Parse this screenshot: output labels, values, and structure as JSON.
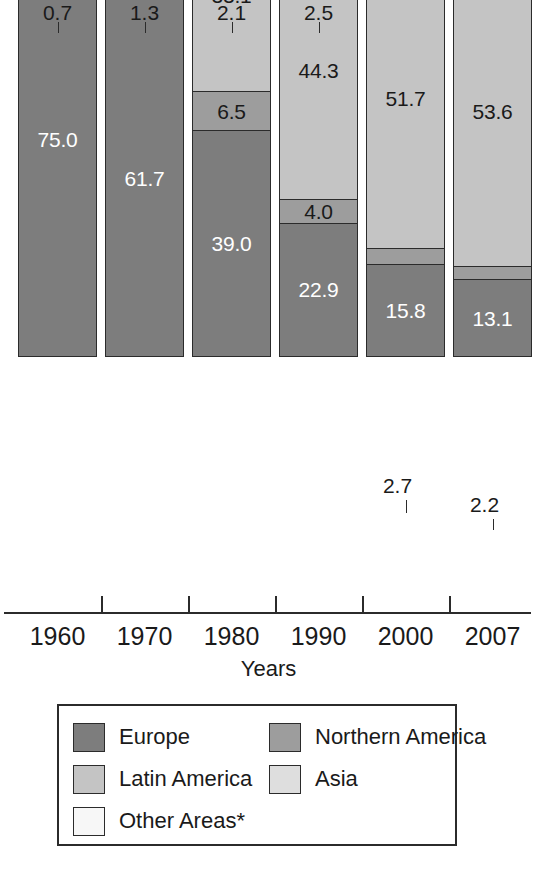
{
  "chart_data": {
    "type": "bar",
    "subtype": "stacked-bar-100-percent",
    "title": "",
    "xlabel": "Years",
    "ylabel": "",
    "ylim": [
      0,
      100
    ],
    "grid": false,
    "legend_position": "bottom",
    "categories": [
      "1960",
      "1970",
      "1980",
      "1990",
      "2000",
      "2007"
    ],
    "series": [
      {
        "name": "Other Areas*",
        "color": "#f7f7f7",
        "values": [
          0.7,
          1.3,
          2.1,
          2.5,
          3.4,
          4.3
        ]
      },
      {
        "name": "Asia",
        "color": "#dedede",
        "values": [
          5.1,
          8.9,
          19.3,
          26.3,
          26.4,
          26.8
        ]
      },
      {
        "name": "Latin America",
        "color": "#c4c4c4",
        "values": [
          9.4,
          19.4,
          33.1,
          44.3,
          51.7,
          53.6
        ]
      },
      {
        "name": "Northern America",
        "color": "#9d9d9d",
        "values": [
          9.8,
          8.7,
          6.5,
          4.0,
          2.7,
          2.2
        ]
      },
      {
        "name": "Europe",
        "color": "#7d7d7d",
        "values": [
          75.0,
          61.7,
          39.0,
          22.9,
          15.8,
          13.1
        ]
      }
    ],
    "stack_order_top_to_bottom": [
      "Other Areas*",
      "Asia",
      "Latin America",
      "Northern America",
      "Europe"
    ],
    "annotations": [
      "* Other Areas"
    ]
  },
  "axis": {
    "title": "Years",
    "ticks": [
      "1960",
      "1970",
      "1980",
      "1990",
      "2000",
      "2007"
    ]
  },
  "legend": {
    "entries": [
      {
        "label": "Europe",
        "color": "#7d7d7d"
      },
      {
        "label": "Northern America",
        "color": "#9d9d9d"
      },
      {
        "label": "Latin America",
        "color": "#c4c4c4"
      },
      {
        "label": "Asia",
        "color": "#dedede"
      },
      {
        "label": "Other Areas*",
        "color": "#f7f7f7"
      }
    ]
  },
  "bars": [
    {
      "year": "1960",
      "segments": [
        {
          "series": "Other Areas*",
          "value": "0.7",
          "label_mode": "callout"
        },
        {
          "series": "Asia",
          "value": "5.1",
          "label_mode": "inside-dark"
        },
        {
          "series": "Latin America",
          "value": "9.4",
          "label_mode": "inside-dark"
        },
        {
          "series": "Northern America",
          "value": "9.8",
          "label_mode": "inside-dark"
        },
        {
          "series": "Europe",
          "value": "75.0",
          "label_mode": "inside-light"
        }
      ]
    },
    {
      "year": "1970",
      "segments": [
        {
          "series": "Other Areas*",
          "value": "1.3",
          "label_mode": "callout"
        },
        {
          "series": "Asia",
          "value": "8.9",
          "label_mode": "inside-dark"
        },
        {
          "series": "Latin America",
          "value": "19.4",
          "label_mode": "inside-dark"
        },
        {
          "series": "Northern America",
          "value": "8.7",
          "label_mode": "inside-dark"
        },
        {
          "series": "Europe",
          "value": "61.7",
          "label_mode": "inside-light"
        }
      ]
    },
    {
      "year": "1980",
      "segments": [
        {
          "series": "Other Areas*",
          "value": "2.1",
          "label_mode": "callout"
        },
        {
          "series": "Asia",
          "value": "19.3",
          "label_mode": "inside-dark"
        },
        {
          "series": "Latin America",
          "value": "33.1",
          "label_mode": "inside-dark"
        },
        {
          "series": "Northern America",
          "value": "6.5",
          "label_mode": "inside-dark"
        },
        {
          "series": "Europe",
          "value": "39.0",
          "label_mode": "inside-light"
        }
      ]
    },
    {
      "year": "1990",
      "segments": [
        {
          "series": "Other Areas*",
          "value": "2.5",
          "label_mode": "callout"
        },
        {
          "series": "Asia",
          "value": "26.3",
          "label_mode": "inside-dark"
        },
        {
          "series": "Latin America",
          "value": "44.3",
          "label_mode": "inside-dark"
        },
        {
          "series": "Northern America",
          "value": "4.0",
          "label_mode": "inside-dark"
        },
        {
          "series": "Europe",
          "value": "22.9",
          "label_mode": "inside-light"
        }
      ]
    },
    {
      "year": "2000",
      "segments": [
        {
          "series": "Other Areas*",
          "value": "3.4",
          "label_mode": "inside-dark"
        },
        {
          "series": "Asia",
          "value": "26.4",
          "label_mode": "inside-dark"
        },
        {
          "series": "Latin America",
          "value": "51.7",
          "label_mode": "inside-dark"
        },
        {
          "series": "Northern America",
          "value": "2.7",
          "label_mode": "callout-inline"
        },
        {
          "series": "Europe",
          "value": "15.8",
          "label_mode": "inside-light"
        }
      ]
    },
    {
      "year": "2007",
      "segments": [
        {
          "series": "Other Areas*",
          "value": "4.3",
          "label_mode": "inside-dark"
        },
        {
          "series": "Asia",
          "value": "26.8",
          "label_mode": "inside-dark"
        },
        {
          "series": "Latin America",
          "value": "53.6",
          "label_mode": "inside-dark"
        },
        {
          "series": "Northern America",
          "value": "2.2",
          "label_mode": "callout-inline"
        },
        {
          "series": "Europe",
          "value": "13.1",
          "label_mode": "inside-light"
        }
      ]
    }
  ]
}
